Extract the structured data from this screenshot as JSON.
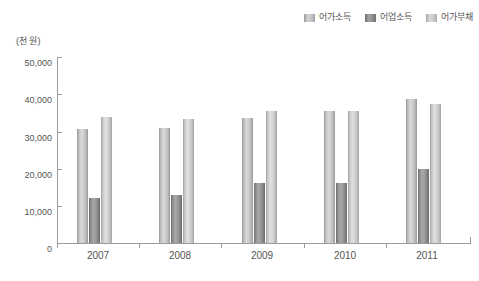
{
  "legend": {
    "position": "top-right",
    "items": [
      {
        "label": "어가소득",
        "key": "income",
        "color": "#cccccc"
      },
      {
        "label": "어업소득",
        "key": "fishery",
        "color": "#909090"
      },
      {
        "label": "어가부채",
        "key": "debt",
        "color": "#d4d4d4"
      }
    ]
  },
  "axis": {
    "unit_caption": "(천 원)",
    "y_ticks": [
      "50,000",
      "40,000",
      "30,000",
      "20,000",
      "10,000",
      "0"
    ],
    "x_ticks": [
      "2007",
      "2008",
      "2009",
      "2010",
      "2011"
    ]
  },
  "chart_data": {
    "type": "bar",
    "title": "",
    "subtitle": "",
    "xlabel": "",
    "ylabel": "(천 원)",
    "ylim": [
      0,
      50000
    ],
    "ytick_interval": 10000,
    "grid": false,
    "legend_position": "top-right",
    "categories": [
      "2007",
      "2008",
      "2009",
      "2010",
      "2011"
    ],
    "series": [
      {
        "name": "어가소득",
        "values": [
          30700,
          31000,
          33600,
          35500,
          38800
        ]
      },
      {
        "name": "어업소득",
        "values": [
          12100,
          13000,
          16100,
          16200,
          20000
        ]
      },
      {
        "name": "어가부채",
        "values": [
          33900,
          33300,
          35500,
          35500,
          37400
        ]
      }
    ]
  }
}
